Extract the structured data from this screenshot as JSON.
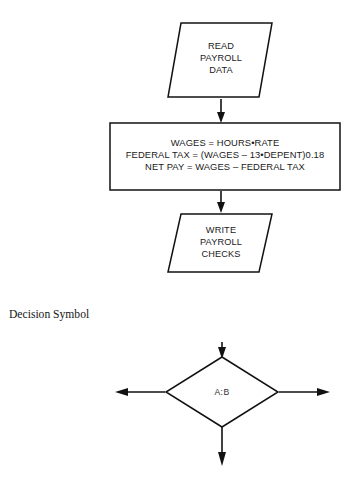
{
  "page": {
    "background_color": "#ffffff",
    "ink_color": "#121212",
    "width": 350,
    "height": 491
  },
  "flowchart": {
    "caption": "Decision Symbol",
    "nodes": [
      {
        "id": "read-payroll-data",
        "shape": "parallelogram",
        "role": "input-output",
        "lines": [
          "READ",
          "PAYROLL",
          "DATA"
        ]
      },
      {
        "id": "payroll-calculations",
        "shape": "rectangle",
        "role": "process",
        "lines": [
          "WAGES = HOURS•RATE",
          "FEDERAL TAX = (WAGES – 13•DEPENT)0.18",
          "NET PAY = WAGES – FEDERAL TAX"
        ]
      },
      {
        "id": "write-payroll-checks",
        "shape": "parallelogram",
        "role": "input-output",
        "lines": [
          "WRITE",
          "PAYROLL",
          "CHECKS"
        ]
      },
      {
        "id": "decision-ab",
        "shape": "diamond",
        "role": "decision",
        "lines": [
          "A:B"
        ]
      }
    ],
    "connectors": [
      {
        "id": "read-to-process",
        "from": "read-payroll-data",
        "to": "payroll-calculations",
        "direction": "down"
      },
      {
        "id": "process-to-write",
        "from": "payroll-calculations",
        "to": "write-payroll-checks",
        "direction": "down"
      },
      {
        "id": "into-decision",
        "from": "",
        "to": "decision-ab",
        "direction": "down"
      },
      {
        "id": "decision-branch-left",
        "from": "decision-ab",
        "to": "",
        "direction": "left"
      },
      {
        "id": "decision-branch-right",
        "from": "decision-ab",
        "to": "",
        "direction": "right"
      },
      {
        "id": "decision-branch-down",
        "from": "decision-ab",
        "to": "",
        "direction": "down"
      }
    ]
  }
}
